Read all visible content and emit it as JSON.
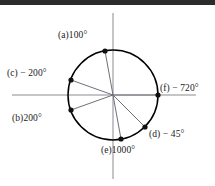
{
  "figure": {
    "background_color": "#ffffff",
    "top_band_color": "#2b2b2b",
    "circle_color": "#000000",
    "axis_color": "#8a8a93",
    "radius_color": "#6f6f78",
    "point_color": "#111111",
    "center": {
      "x": 113,
      "y": 95
    },
    "radius": 45,
    "axes": {
      "horizontal": {
        "x1": 12,
        "y1": 95,
        "x2": 196,
        "y2": 95
      },
      "vertical": {
        "x1": 113,
        "y1": 13,
        "x2": 113,
        "y2": 179
      }
    }
  },
  "chart_data": {
    "type": "scatter",
    "xlabel": "",
    "ylabel": "",
    "xlim": [
      -1.4,
      1.4
    ],
    "ylim": [
      -1.4,
      1.4
    ],
    "grid": false,
    "legend": "none",
    "unit_circle": true,
    "points": [
      {
        "key": "a",
        "label": "(a)100°",
        "angle_deg": 100,
        "degrees": 100,
        "x": -0.1736,
        "y": 0.9848,
        "px": 105,
        "py": 51,
        "label_x": 58,
        "label_y": 31,
        "label_anchor": "left"
      },
      {
        "key": "b",
        "label": "(b)200°",
        "angle_deg": 200,
        "degrees": 200,
        "x": -0.9397,
        "y": -0.342,
        "px": 71,
        "py": 110,
        "label_x": 12,
        "label_y": 114,
        "label_anchor": "left"
      },
      {
        "key": "c",
        "label": "(c) − 200°",
        "angle_deg": 160,
        "degrees": -200,
        "x": -0.9397,
        "y": 0.342,
        "px": 71,
        "py": 80,
        "label_x": 7,
        "label_y": 69,
        "label_anchor": "left"
      },
      {
        "key": "d",
        "label": "(d) − 45°",
        "angle_deg": -45,
        "degrees": -45,
        "x": 0.7071,
        "y": -0.7071,
        "px": 145,
        "py": 127,
        "label_x": 149,
        "label_y": 130,
        "label_anchor": "left"
      },
      {
        "key": "e",
        "label": "(e)1000°",
        "angle_deg": 280,
        "degrees": 1000,
        "x": 0.1736,
        "y": -0.9848,
        "px": 121,
        "py": 139,
        "label_x": 101,
        "label_y": 146,
        "label_anchor": "left"
      },
      {
        "key": "f",
        "label": "(f) − 720°",
        "angle_deg": 0,
        "degrees": -720,
        "x": 1.0,
        "y": 0.0,
        "px": 158,
        "py": 95,
        "label_x": 160,
        "label_y": 84,
        "label_anchor": "left"
      }
    ]
  }
}
